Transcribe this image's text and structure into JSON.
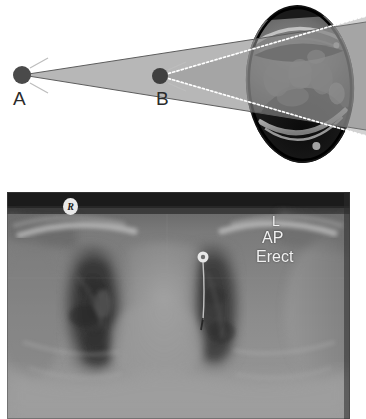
{
  "figure": {
    "background": "#ffffff",
    "width": 366,
    "height": 419
  },
  "diagram": {
    "name": "beam-geometry-diagram",
    "beam_color": "#8a8a8a",
    "beam_edge_color": "#5a5a5a",
    "dotted_ray_color": "#ffffff",
    "source_color": "#4a4a4a",
    "sources": [
      {
        "id": "A",
        "label": "A",
        "meaning": "distant x-ray source",
        "x": 22,
        "y": 75,
        "radius": 9,
        "label_x": 13,
        "label_y": 89,
        "beam_style": "solid-gray-cone"
      },
      {
        "id": "B",
        "label": "B",
        "meaning": "near x-ray source",
        "x": 160,
        "y": 76,
        "radius": 8,
        "label_x": 156,
        "label_y": 89,
        "beam_style": "white-dotted-cone"
      }
    ],
    "ct_slice": {
      "name": "axial-ct-thorax-slice",
      "center_x": 300,
      "center_y": 84,
      "width": 110,
      "height": 160,
      "modality": "axial CT / MRI cross-section of thorax",
      "rotation_deg": -4
    }
  },
  "radiograph": {
    "name": "chest-radiograph",
    "modality": "AP erect chest radiograph",
    "frame": {
      "x": 7,
      "y": 192,
      "width": 343,
      "height": 227
    },
    "markers": {
      "side_right": "R",
      "side_left": "L",
      "projection": "AP",
      "patient_position": "Erect"
    },
    "features": [
      "right lung field",
      "left lung field",
      "cardiac silhouette",
      "central venous catheter tip",
      "clavicles",
      "diaphragm"
    ]
  }
}
